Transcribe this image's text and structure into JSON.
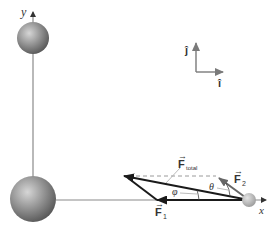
{
  "diagram": {
    "axes": {
      "x_label": "x",
      "y_label": "y"
    },
    "unit_vectors": {
      "i_label": "î",
      "j_label": "ĵ"
    },
    "forces": {
      "f1_label": "F",
      "f1_sub": "1",
      "f2_label": "F",
      "f2_sub": "2",
      "ftotal_label": "F",
      "ftotal_sub": "total"
    },
    "angles": {
      "phi": "φ",
      "theta": "θ"
    },
    "colors": {
      "axis": "#8a8a8a",
      "vector": "#1a1a1a",
      "f2_vector": "#6e6e6e",
      "dashed": "#9a9a9a",
      "sphere_light": "#d0d0d0",
      "sphere_dark": "#5a5a5a"
    }
  }
}
